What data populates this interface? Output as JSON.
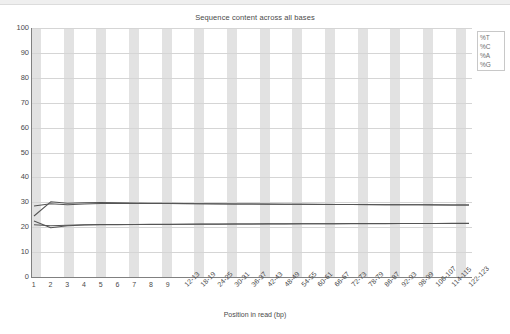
{
  "chart": {
    "title": "Sequence content across all bases",
    "xlabel": "Position in read (bp)",
    "ylabel": ""
  },
  "legend": {
    "items": [
      {
        "label": "%T",
        "color": "#d14545"
      },
      {
        "label": "%C",
        "color": "#2f6fb5"
      },
      {
        "label": "%A",
        "color": "#3c9a3c"
      },
      {
        "label": "%G",
        "color": "#303030"
      }
    ]
  },
  "axes": {
    "y_ticks": [
      "100",
      "90",
      "80",
      "70",
      "60",
      "50",
      "40",
      "30",
      "20",
      "10",
      "0"
    ],
    "y_min": 0,
    "y_max": 100,
    "x_ticks": [
      "1",
      "2",
      "3",
      "4",
      "5",
      "6",
      "7",
      "8",
      "9",
      "12-13",
      "18-19",
      "24-25",
      "30-31",
      "36-37",
      "42-43",
      "48-49",
      "54-55",
      "60-61",
      "66-67",
      "72-73",
      "78-79",
      "86-87",
      "92-93",
      "98-99",
      "106-107",
      "114-115",
      "122-123"
    ]
  },
  "chart_data": {
    "type": "line",
    "title": "Sequence content across all bases",
    "xlabel": "Position in read (bp)",
    "ylabel": "",
    "ylim": [
      0,
      100
    ],
    "grid": true,
    "legend_position": "top-right",
    "categories": [
      "1",
      "2",
      "3",
      "4",
      "5",
      "6",
      "7",
      "8",
      "9",
      "12-13",
      "18-19",
      "24-25",
      "30-31",
      "36-37",
      "42-43",
      "48-49",
      "54-55",
      "60-61",
      "66-67",
      "72-73",
      "78-79",
      "86-87",
      "92-93",
      "98-99",
      "106-107",
      "114-115",
      "122-123"
    ],
    "series": [
      {
        "name": "%T",
        "color": "#d14545",
        "values": [
          24.5,
          30.2,
          29.6,
          29.8,
          29.9,
          29.8,
          29.7,
          29.6,
          29.6,
          29.5,
          29.4,
          29.4,
          29.3,
          29.3,
          29.3,
          29.2,
          29.2,
          29.2,
          29.1,
          29.1,
          29.1,
          29.0,
          29.0,
          29.0,
          29.0,
          28.9,
          28.9
        ]
      },
      {
        "name": "%C",
        "color": "#2f6fb5",
        "values": [
          22.5,
          19.8,
          20.6,
          20.9,
          21.0,
          21.0,
          21.1,
          21.1,
          21.1,
          21.2,
          21.2,
          21.2,
          21.3,
          21.3,
          21.3,
          21.3,
          21.4,
          21.4,
          21.4,
          21.4,
          21.4,
          21.4,
          21.5,
          21.5,
          21.5,
          21.5,
          21.5
        ]
      },
      {
        "name": "%A",
        "color": "#3c9a3c",
        "values": [
          28.5,
          29.4,
          29.0,
          29.3,
          29.5,
          29.5,
          29.5,
          29.5,
          29.5,
          29.4,
          29.4,
          29.3,
          29.3,
          29.3,
          29.2,
          29.2,
          29.2,
          29.1,
          29.1,
          29.1,
          29.0,
          29.0,
          29.0,
          29.0,
          28.9,
          28.9,
          28.9
        ]
      },
      {
        "name": "%G",
        "color": "#303030",
        "values": [
          21.0,
          20.6,
          20.8,
          21.0,
          21.1,
          21.1,
          21.1,
          21.2,
          21.2,
          21.2,
          21.3,
          21.3,
          21.3,
          21.3,
          21.4,
          21.4,
          21.4,
          21.4,
          21.4,
          21.5,
          21.5,
          21.5,
          21.5,
          21.5,
          21.5,
          21.6,
          21.6
        ]
      }
    ]
  }
}
